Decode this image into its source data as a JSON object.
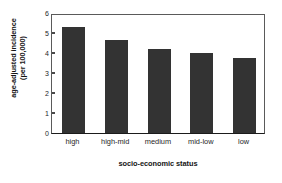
{
  "chart_data": {
    "type": "bar",
    "title": "",
    "categories": [
      "high",
      "high-mid",
      "medium",
      "mid-low",
      "low"
    ],
    "values": [
      5.3,
      4.65,
      4.2,
      4.0,
      3.75
    ],
    "xlabel": "socio-economic status",
    "ylabel": "age-adjusted incidence (per 100,000)",
    "ylabel_lines": [
      "age-adjusted incidence",
      "(per 100,000)"
    ],
    "ylim": [
      0,
      6
    ],
    "yticks": [
      0,
      1,
      2,
      3,
      4,
      5,
      6
    ],
    "ytick_labels": [
      "0",
      "1",
      "2",
      "3",
      "4",
      "5",
      "6"
    ],
    "grid": false,
    "legend": null,
    "bar_color": "#333333",
    "axis_color": "#5a5a5a",
    "background": "#ffffff"
  }
}
